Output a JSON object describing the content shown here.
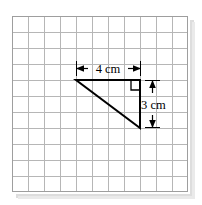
{
  "figure": {
    "background_color": "#ffffff",
    "grid": {
      "rows": 11,
      "columns": 11,
      "cell_size_px": 16,
      "origin_x_px": 12,
      "origin_y_px": 16,
      "line_color": "#b4b4b4",
      "border_color": "#9a9a9a",
      "shadow_color": "#d8d8d8"
    },
    "shape": {
      "kind": "right-triangle",
      "stroke_color": "#000000",
      "stroke_width_px": 2,
      "vertices": [
        {
          "name": "top-left",
          "x": 76,
          "y": 80
        },
        {
          "name": "right-angle-corner",
          "x": 140,
          "y": 80
        },
        {
          "name": "bottom-right",
          "x": 140,
          "y": 128
        }
      ],
      "right_angle_marker": {
        "x": 131,
        "y": 81,
        "size_px": 9,
        "color": "#000000"
      }
    },
    "dimensions": [
      {
        "id": "base",
        "label": "4 cm",
        "orientation": "horizontal",
        "value": 4,
        "unit": "cm",
        "line_y_px": 68,
        "from_x_px": 76,
        "to_x_px": 140,
        "color": "#000000"
      },
      {
        "id": "height",
        "label": "3 cm",
        "orientation": "vertical",
        "value": 3,
        "unit": "cm",
        "line_x_px": 152,
        "from_y_px": 80,
        "to_y_px": 128,
        "color": "#000000"
      }
    ]
  }
}
